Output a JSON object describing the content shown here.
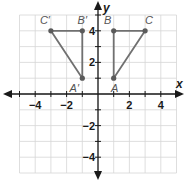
{
  "diagram": {
    "type": "coordinate-plane",
    "x_axis_label": "x",
    "y_axis_label": "y",
    "x_range": [
      -5,
      5
    ],
    "y_range": [
      -5,
      5
    ],
    "x_tick_labels": [
      {
        "value": -4,
        "text": "−4"
      },
      {
        "value": -2,
        "text": "−2"
      },
      {
        "value": 2,
        "text": "2"
      },
      {
        "value": 4,
        "text": "4"
      }
    ],
    "y_tick_labels": [
      {
        "value": 4,
        "text": "4"
      },
      {
        "value": 2,
        "text": "2"
      },
      {
        "value": -2,
        "text": "−2"
      },
      {
        "value": -4,
        "text": "−4"
      }
    ],
    "triangles": [
      {
        "name": "triangle-ABC",
        "vertices": [
          {
            "label": "A",
            "x": 1,
            "y": 1
          },
          {
            "label": "B",
            "x": 1,
            "y": 4
          },
          {
            "label": "C",
            "x": 3,
            "y": 4
          }
        ]
      },
      {
        "name": "triangle-A'B'C'",
        "vertices": [
          {
            "label": "A′",
            "x": -1,
            "y": 1
          },
          {
            "label": "B′",
            "x": -1,
            "y": 4
          },
          {
            "label": "C′",
            "x": -3,
            "y": 4
          }
        ]
      }
    ],
    "colors": {
      "grid": "#d6d6d6",
      "axis": "#1a1a1a",
      "triangle": "#707070",
      "point": "#5a5a5a"
    }
  }
}
